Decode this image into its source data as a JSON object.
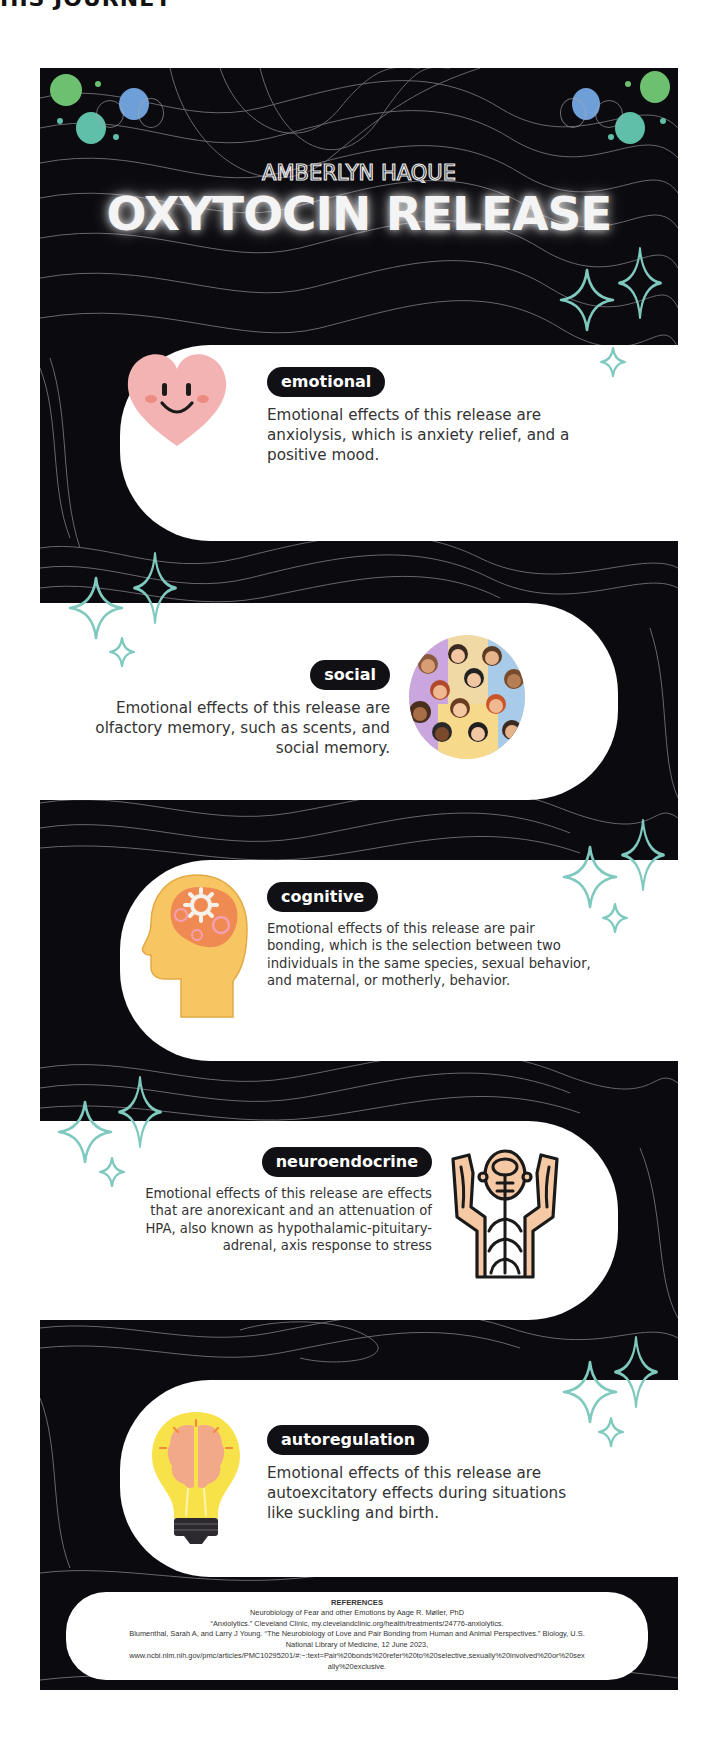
{
  "page_top_fragment": "HIS JOURNEY",
  "header": {
    "author": "AMBERLYN HAQUE",
    "title": "OXYTOCIN RELEASE"
  },
  "colors": {
    "background": "#0b0a0e",
    "card": "#ffffff",
    "pill": "#111014",
    "sparkle": "#7fc9bf",
    "bubble_green": "#6cc070",
    "bubble_blue": "#6f9fd8",
    "bubble_teal": "#5fbfa8"
  },
  "sections": [
    {
      "tag": "emotional",
      "icon": "smiling-heart-icon",
      "description_lines": [
        "Emotional effects of this release are",
        "anxiolysis, which is anxiety relief, and a",
        "positive mood."
      ]
    },
    {
      "tag": "social",
      "icon": "crowd-of-people-icon",
      "description_lines": [
        "Emotional effects of this release are",
        "olfactory memory, such as scents, and",
        "social memory."
      ]
    },
    {
      "tag": "cognitive",
      "icon": "head-with-gears-icon",
      "description_lines": [
        "Emotional effects of this release are pair",
        "bonding, which is the selection between two",
        "individuals in the same species, sexual behavior,",
        "and maternal, or motherly, behavior."
      ]
    },
    {
      "tag": "neuroendocrine",
      "icon": "nervous-system-body-icon",
      "description_lines": [
        "Emotional effects of this release are  effects",
        "that are anorexicant and an attenuation of",
        "HPA, also known as hypothalamic-pituitary-",
        "adrenal, axis response to stress"
      ]
    },
    {
      "tag": "autoregulation",
      "icon": "lightbulb-brain-icon",
      "description_lines": [
        "Emotional effects of this release are",
        "autoexcitatory effects during situations",
        "like suckling and birth."
      ]
    }
  ],
  "references": {
    "heading": "REFERENCES",
    "lines": [
      "Neurobiology of Fear and other Emotions by Aage R. Møller, PhD",
      "“Anxiolytics.” Cleveland Clinic, my.clevelandclinic.org/health/treatments/24776-anxiolytics.",
      "Blumenthal, Sarah A, and Larry J Young. “The Neurobiology of Love and Pair Bonding from Human and Animal Perspectives.” Biology, U.S.",
      "National Library of Medicine, 12 June 2023,",
      "www.ncbi.nlm.nih.gov/pmc/articles/PMC10295201/#:~:text=Pair%20bonds%20refer%20to%20selective,sexually%20involved%20or%20sex",
      "ally%20exclusive."
    ]
  }
}
